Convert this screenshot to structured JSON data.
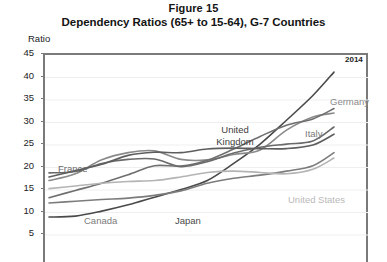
{
  "figure": {
    "number_label": "Figure 15",
    "title": "Dependency Ratios (65+ to 15-64), G-7 Countries",
    "axis_unit_label": "Ratio",
    "end_year_annotation": "2014"
  },
  "chart_data": {
    "type": "line",
    "title": "Dependency Ratios (65+ to 15-64), G-7 Countries",
    "subtitle": "Figure 15",
    "xlabel": "",
    "ylabel": "Ratio",
    "ylim": [
      5,
      45
    ],
    "yticks": [
      5,
      10,
      15,
      20,
      25,
      30,
      35,
      40,
      45
    ],
    "ytick_labels": [
      "5",
      "10",
      "15",
      "20",
      "25",
      "30",
      "35",
      "40",
      "45"
    ],
    "grid": true,
    "grid_axis": "y",
    "legend": "inline-labels",
    "x": [
      1960,
      1965,
      1970,
      1975,
      1980,
      1985,
      1990,
      1995,
      2000,
      2005,
      2010,
      2014
    ],
    "series": [
      {
        "name": "Japan",
        "color": "#4a4a4a",
        "label_position": "bottom-center",
        "values": [
          9.0,
          9.2,
          10.3,
          11.7,
          13.4,
          15.1,
          17.1,
          20.9,
          25.2,
          30.5,
          36.0,
          41.2
        ]
      },
      {
        "name": "Germany",
        "color": "#8a8a8a",
        "label_position": "upper-right",
        "values": [
          17.1,
          18.6,
          21.7,
          23.3,
          23.7,
          21.8,
          21.7,
          22.9,
          23.9,
          28.3,
          31.2,
          32.1
        ]
      },
      {
        "name": "Italy",
        "color": "#6f6f6f",
        "label_position": "right",
        "values": [
          13.3,
          14.9,
          16.5,
          18.4,
          20.4,
          20.3,
          21.6,
          24.1,
          26.9,
          29.4,
          30.8,
          33.1
        ]
      },
      {
        "name": "France",
        "color": "#6a6a6a",
        "label_position": "left",
        "values": [
          18.8,
          19.1,
          20.9,
          21.8,
          21.9,
          20.2,
          21.3,
          23.2,
          24.5,
          25.2,
          25.9,
          29.0
        ]
      },
      {
        "name": "United Kingdom",
        "color": "#5e5e5e",
        "label_position": "center",
        "values": [
          17.9,
          19.3,
          20.7,
          22.7,
          23.4,
          23.3,
          24.1,
          24.3,
          24.2,
          24.2,
          25.0,
          27.4
        ]
      },
      {
        "name": "Canada",
        "color": "#7c7c7c",
        "label_position": "bottom-left",
        "values": [
          12.1,
          12.5,
          12.9,
          13.2,
          13.8,
          14.8,
          16.5,
          17.6,
          18.3,
          19.2,
          20.4,
          23.3
        ]
      },
      {
        "name": "United States",
        "color": "#b4b4b4",
        "label_position": "bottom-right",
        "values": [
          15.3,
          15.9,
          16.5,
          16.9,
          17.1,
          17.9,
          18.9,
          19.2,
          18.9,
          18.6,
          19.6,
          22.1
        ]
      }
    ],
    "annotations": [
      {
        "text": "2014",
        "x": 2014,
        "note": "last data year marker, top-right"
      }
    ]
  }
}
